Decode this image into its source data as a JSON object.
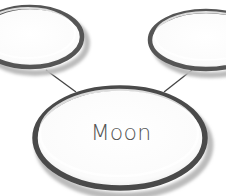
{
  "diagram": {
    "type": "node-link",
    "nodes": [
      {
        "id": "left",
        "label": ""
      },
      {
        "id": "right",
        "label": ""
      },
      {
        "id": "moon",
        "label": "Moon"
      }
    ],
    "edges": [
      {
        "from": "left",
        "to": "moon"
      },
      {
        "from": "right",
        "to": "moon"
      }
    ],
    "colors": {
      "ring": "#4a4a4a",
      "line": "#444444",
      "text": "#555555",
      "fill": "#ffffff"
    }
  }
}
